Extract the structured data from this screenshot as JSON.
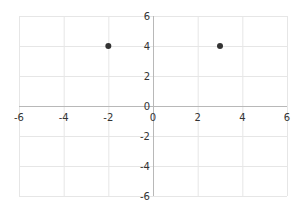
{
  "chart_data": {
    "type": "scatter",
    "title": "",
    "xlabel": "",
    "ylabel": "",
    "xlim": [
      -6,
      6
    ],
    "ylim": [
      -6,
      6
    ],
    "grid": true,
    "x_ticks": [
      -6,
      -4,
      -2,
      0,
      2,
      4,
      6
    ],
    "y_ticks": [
      -6,
      -4,
      -2,
      0,
      2,
      4,
      6
    ],
    "x_tick_labels": [
      "-6",
      "-4",
      "-2",
      "0",
      "2",
      "4",
      "6"
    ],
    "y_tick_labels": [
      "6",
      "4",
      "2",
      "0",
      "-2",
      "-4",
      "-6"
    ],
    "series": [
      {
        "name": "points",
        "points": [
          {
            "x": -2,
            "y": 4
          },
          {
            "x": 3,
            "y": 4
          }
        ],
        "color": "#333333"
      }
    ]
  },
  "layout": {
    "plot_left": 19,
    "plot_right": 287,
    "plot_top": 16,
    "plot_bottom": 196,
    "origin_x": 153,
    "origin_y": 106
  }
}
